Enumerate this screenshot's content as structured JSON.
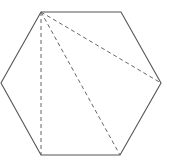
{
  "diagram": {
    "type": "geometry",
    "shape": "regular hexagon with diagonals from one vertex",
    "stroke_color": "#555555",
    "dash_color": "#666666",
    "vertices": [
      {
        "name": "top-left",
        "x": 41,
        "y": 12
      },
      {
        "name": "top-right",
        "x": 121,
        "y": 12
      },
      {
        "name": "right",
        "x": 161,
        "y": 83
      },
      {
        "name": "bottom-right",
        "x": 120,
        "y": 155
      },
      {
        "name": "bottom-left",
        "x": 41,
        "y": 155
      },
      {
        "name": "left",
        "x": 1,
        "y": 83
      }
    ],
    "diagonals": [
      {
        "from": "top-left",
        "to": "right",
        "style": "dashed"
      },
      {
        "from": "top-left",
        "to": "bottom-right",
        "style": "dashed"
      },
      {
        "from": "top-left",
        "to": "bottom-left",
        "style": "dashed"
      }
    ],
    "labels": []
  }
}
